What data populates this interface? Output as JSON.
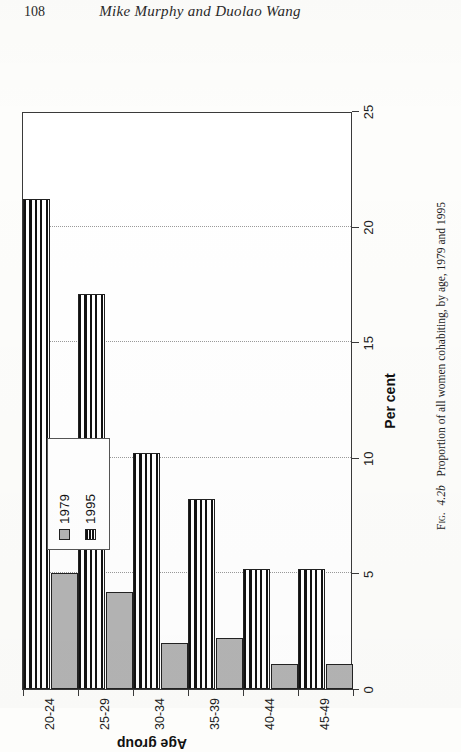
{
  "page": {
    "number": "108",
    "running_title": "Mike Murphy and Duolao Wang"
  },
  "figure": {
    "label_prefix": "Fig.",
    "number": "4.2b",
    "caption": "Proportion of all women cohabiting, by age, 1979 and 1995",
    "caption_full": "Fig. 4.2b Proportion of all women cohabiting, by age, 1979 and 1995"
  },
  "legend": {
    "entries": [
      {
        "label": "1979",
        "swatch": "solid-gray",
        "color": "#b4b4b4"
      },
      {
        "label": "1995",
        "swatch": "horizontal-stripes",
        "color": "#111111"
      }
    ]
  },
  "chart_data": {
    "type": "bar",
    "orientation": "horizontal",
    "title": "",
    "xlabel": "Per cent",
    "ylabel": "Age group",
    "categories": [
      "20-24",
      "25-29",
      "30-34",
      "35-39",
      "40-44",
      "45-49"
    ],
    "series": [
      {
        "name": "1979",
        "values": [
          5.0,
          4.2,
          2.0,
          2.2,
          1.1,
          1.1
        ]
      },
      {
        "name": "1995",
        "values": [
          21.2,
          17.1,
          10.2,
          8.2,
          5.2,
          5.2
        ]
      }
    ],
    "xlim": [
      0,
      25
    ],
    "xticks": [
      0,
      5,
      10,
      15,
      20,
      25
    ],
    "xtick_labels": [
      "0",
      "5",
      "10",
      "15",
      "20",
      "25"
    ],
    "grid": "vertical-dotted",
    "legend_position": "upper-left"
  }
}
